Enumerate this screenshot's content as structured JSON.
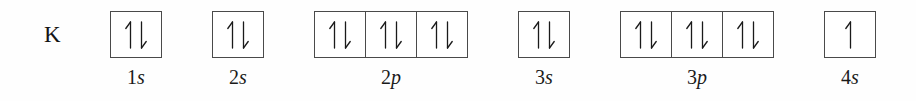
{
  "figure": {
    "element_symbol": "K",
    "element_name": "potassium",
    "diagram_type": "orbital-filling-diagram"
  },
  "subshells": [
    {
      "label_n": "1",
      "label_l": "s",
      "label": "1s",
      "left": 110,
      "boxes": [
        {
          "electrons": [
            "up",
            "down"
          ]
        }
      ]
    },
    {
      "label_n": "2",
      "label_l": "s",
      "label": "2s",
      "left": 212,
      "boxes": [
        {
          "electrons": [
            "up",
            "down"
          ]
        }
      ]
    },
    {
      "label_n": "2",
      "label_l": "p",
      "label": "2p",
      "left": 314,
      "boxes": [
        {
          "electrons": [
            "up",
            "down"
          ]
        },
        {
          "electrons": [
            "up",
            "down"
          ]
        },
        {
          "electrons": [
            "up",
            "down"
          ]
        }
      ]
    },
    {
      "label_n": "3",
      "label_l": "s",
      "label": "3s",
      "left": 518,
      "boxes": [
        {
          "electrons": [
            "up",
            "down"
          ]
        }
      ]
    },
    {
      "label_n": "3",
      "label_l": "p",
      "label": "3p",
      "left": 620,
      "boxes": [
        {
          "electrons": [
            "up",
            "down"
          ]
        },
        {
          "electrons": [
            "up",
            "down"
          ]
        },
        {
          "electrons": [
            "up",
            "down"
          ]
        }
      ]
    },
    {
      "label_n": "4",
      "label_l": "s",
      "label": "4s",
      "left": 824,
      "boxes": [
        {
          "electrons": [
            "up"
          ]
        }
      ]
    }
  ],
  "colors": {
    "background": "#fefefe",
    "box_border": "#4a4a4a",
    "ink": "#1a1a1a"
  }
}
